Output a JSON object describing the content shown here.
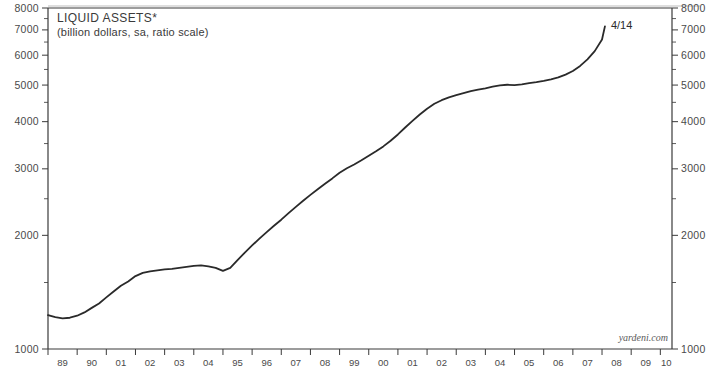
{
  "chart_data": {
    "type": "line",
    "title": "LIQUID ASSETS*",
    "subtitle": "(billion dollars, sa, ratio scale)",
    "xlabel": "",
    "ylabel": "",
    "scale": "log",
    "grid": false,
    "legend_position": "none",
    "watermark": "yardeni.com",
    "endpoint_label": "4/14",
    "ylim": [
      1000,
      8000
    ],
    "xlim": [
      1989,
      2010.4
    ],
    "ytick_labels": [
      "8000",
      "7000",
      "6000",
      "5000",
      "4000",
      "3000",
      "2000",
      "1000"
    ],
    "ytick_values": [
      8000,
      7000,
      6000,
      5000,
      4000,
      3000,
      2000,
      1000
    ],
    "ytick_minor_values": [
      7500,
      6500,
      5500,
      4500,
      3500,
      2500,
      1500
    ],
    "xtick_labels": [
      "89",
      "90",
      "01",
      "02",
      "03",
      "04",
      "95",
      "96",
      "07",
      "08",
      "99",
      "00",
      "01",
      "02",
      "03",
      "04",
      "05",
      "06",
      "07",
      "08",
      "09",
      "10"
    ],
    "xtick_years": [
      1989,
      1990,
      1991,
      1992,
      1993,
      1994,
      1995,
      1996,
      1997,
      1998,
      1999,
      2000,
      2001,
      2002,
      2003,
      2004,
      2005,
      2006,
      2007,
      2008,
      2009,
      2010
    ],
    "series": [
      {
        "name": "Liquid Assets",
        "x": [
          1989.0,
          1989.25,
          1989.5,
          1989.75,
          1990.0,
          1990.25,
          1990.5,
          1990.75,
          1991.0,
          1991.25,
          1991.5,
          1991.75,
          1992.0,
          1992.25,
          1992.5,
          1992.75,
          1993.0,
          1993.25,
          1993.5,
          1993.75,
          1994.0,
          1994.25,
          1994.5,
          1994.75,
          1995.0,
          1995.25,
          1995.5,
          1995.75,
          1996.0,
          1996.25,
          1996.5,
          1996.75,
          1997.0,
          1997.25,
          1997.5,
          1997.75,
          1998.0,
          1998.25,
          1998.5,
          1998.75,
          1999.0,
          1999.25,
          1999.5,
          1999.75,
          2000.0,
          2000.25,
          2000.5,
          2000.75,
          2001.0,
          2001.25,
          2001.5,
          2001.75,
          2002.0,
          2002.25,
          2002.5,
          2002.75,
          2003.0,
          2003.25,
          2003.5,
          2003.75,
          2004.0,
          2004.25,
          2004.5,
          2004.75,
          2005.0,
          2005.25,
          2005.5,
          2005.75,
          2006.0,
          2006.25,
          2006.5,
          2006.75,
          2007.0,
          2007.25,
          2007.5,
          2007.75,
          2008.0,
          2008.1
        ],
        "values": [
          1230,
          1215,
          1205,
          1210,
          1225,
          1250,
          1285,
          1320,
          1370,
          1420,
          1470,
          1510,
          1560,
          1590,
          1605,
          1615,
          1625,
          1630,
          1640,
          1650,
          1660,
          1665,
          1655,
          1640,
          1610,
          1640,
          1720,
          1800,
          1880,
          1960,
          2040,
          2120,
          2200,
          2290,
          2380,
          2470,
          2560,
          2650,
          2740,
          2830,
          2930,
          3010,
          3080,
          3160,
          3250,
          3340,
          3440,
          3560,
          3700,
          3860,
          4020,
          4180,
          4330,
          4460,
          4560,
          4640,
          4700,
          4760,
          4820,
          4860,
          4900,
          4950,
          4990,
          5010,
          5000,
          5020,
          5060,
          5090,
          5130,
          5180,
          5240,
          5330,
          5450,
          5620,
          5850,
          6150,
          6600,
          7150
        ]
      }
    ],
    "annotations": [
      {
        "text": "4/14",
        "x": 2008.1,
        "y": 7150
      }
    ]
  }
}
